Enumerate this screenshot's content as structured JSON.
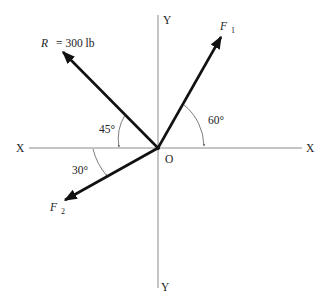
{
  "diagram": {
    "axes": {
      "x_left_label": "X",
      "x_right_label": "X",
      "y_top_label": "Y",
      "y_bottom_label": "Y",
      "origin_label": "O"
    },
    "vectors": [
      {
        "id": "R",
        "label": "R",
        "equals": "= 300 lb",
        "angle_label": "45°",
        "angle_ref": "negative X axis",
        "direction": "up-left"
      },
      {
        "id": "F1",
        "label": "F",
        "subscript": "1",
        "angle_label": "60°",
        "angle_ref": "positive X axis",
        "direction": "up-right"
      },
      {
        "id": "F2",
        "label": "F",
        "subscript": "2",
        "angle_label": "30°",
        "angle_ref": "negative X axis",
        "direction": "down-left"
      }
    ],
    "colors": {
      "axis": "#8a8a8a",
      "vector": "#111111",
      "text": "#222222"
    }
  }
}
